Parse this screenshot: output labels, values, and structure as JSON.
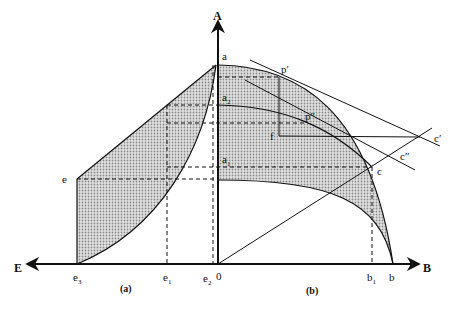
{
  "diagram": {
    "axes": {
      "vertical": "A",
      "right": "B",
      "left": "E",
      "origin": "0"
    },
    "captions": {
      "left_panel": "(a)",
      "right_panel": "(b)"
    },
    "points": {
      "a": "a",
      "a1": "a",
      "a1_sub": "1",
      "a2": "a",
      "a2_sub": "2",
      "p_prime": "p′",
      "p_double_prime": "p″",
      "f": "f",
      "c": "c",
      "c_prime": "c′",
      "c_double_prime": "c″",
      "e": "e",
      "b": "b",
      "b1": "b",
      "b1_sub": "1",
      "e1": "e",
      "e1_sub": "1",
      "e2": "e",
      "e2_sub": "2",
      "e3": "e",
      "e3_sub": "3"
    },
    "colors": {
      "ink": "#111111",
      "shade": "#c8c8c8"
    }
  }
}
